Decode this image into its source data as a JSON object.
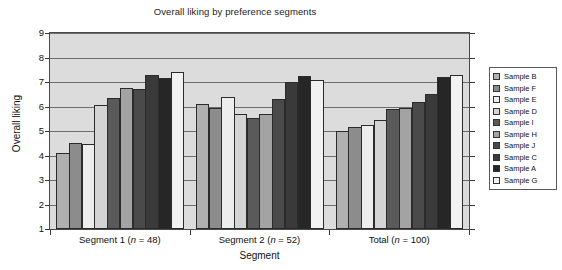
{
  "chart_data": {
    "type": "bar",
    "title": "Overall liking by preference segments",
    "xlabel": "Segment",
    "ylabel": "Overall liking",
    "ylim": [
      1,
      9
    ],
    "yticks": [
      1,
      2,
      3,
      4,
      5,
      6,
      7,
      8,
      9
    ],
    "grid": true,
    "legend_position": "right",
    "categories": [
      "Segment 1 (n = 48)",
      "Segment 2 (n = 52)",
      "Total (n = 100)"
    ],
    "category_parts": [
      {
        "name": "Segment 1",
        "n_prefix": "(",
        "n_var": "n",
        "n_eq": " = 48)"
      },
      {
        "name": "Segment 2",
        "n_prefix": "(",
        "n_var": "n",
        "n_eq": " = 52)"
      },
      {
        "name": "Total",
        "n_prefix": "(",
        "n_var": "n",
        "n_eq": " = 100)"
      }
    ],
    "series": [
      {
        "name": "Sample B",
        "color": "#b0b0b0",
        "values": [
          4.1,
          6.1,
          5.0
        ]
      },
      {
        "name": "Sample F",
        "color": "#8c8c8c",
        "values": [
          4.5,
          5.95,
          5.15
        ]
      },
      {
        "name": "Sample E",
        "color": "#ededed",
        "values": [
          4.45,
          6.4,
          5.25
        ]
      },
      {
        "name": "Sample D",
        "color": "#d4d4d4",
        "values": [
          6.05,
          5.7,
          5.45
        ]
      },
      {
        "name": "Sample I",
        "color": "#5a5a5a",
        "values": [
          6.35,
          5.55,
          5.9
        ]
      },
      {
        "name": "Sample H",
        "color": "#a3a3a3",
        "values": [
          6.75,
          5.7,
          5.95
        ]
      },
      {
        "name": "Sample J",
        "color": "#4a4a4a",
        "values": [
          6.7,
          6.3,
          6.2
        ]
      },
      {
        "name": "Sample C",
        "color": "#3a3a3a",
        "values": [
          7.3,
          7.0,
          6.5
        ]
      },
      {
        "name": "Sample A",
        "color": "#262626",
        "values": [
          7.15,
          7.25,
          7.2
        ]
      },
      {
        "name": "Sample G",
        "color": "#f2f2f2",
        "values": [
          7.4,
          7.1,
          7.28
        ]
      }
    ]
  },
  "legend": {
    "items": [
      {
        "label": "Sample B"
      },
      {
        "label": "Sample F"
      },
      {
        "label": "Sample E"
      },
      {
        "label": "Sample D"
      },
      {
        "label": "Sample I"
      },
      {
        "label": "Sample H"
      },
      {
        "label": "Sample J"
      },
      {
        "label": "Sample C"
      },
      {
        "label": "Sample A"
      },
      {
        "label": "Sample G"
      }
    ]
  },
  "colors": {
    "plot_background": "#dcdcdc",
    "gridline": "#6d6d6d",
    "axis": "#3a3a3a",
    "page_background": "#ffffff",
    "text": "#111111"
  }
}
